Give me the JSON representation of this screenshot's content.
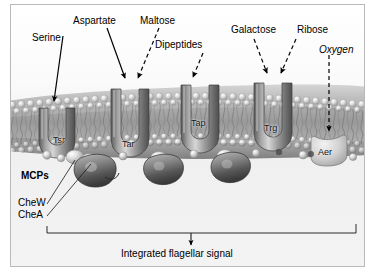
{
  "figure": {
    "background_color": "#f4f4f4",
    "border_color": "#b9b9b9",
    "ink_color": "#000000"
  },
  "ligand_labels": [
    {
      "name": "serine",
      "text": "Serine",
      "arrow": "solid",
      "target": "Tsr"
    },
    {
      "name": "aspartate",
      "text": "Aspartate",
      "arrow": "solid",
      "target": "Tar"
    },
    {
      "name": "maltose",
      "text": "Maltose",
      "arrow": "dashed",
      "target": "Tar"
    },
    {
      "name": "dipeptides",
      "text": "Dipeptides",
      "arrow": "dashed",
      "target": "Tap"
    },
    {
      "name": "galactose",
      "text": "Galactose",
      "arrow": "dashed",
      "target": "Trg"
    },
    {
      "name": "ribose",
      "text": "Ribose",
      "arrow": "dashed",
      "target": "Trg"
    },
    {
      "name": "oxygen",
      "text": "Oxygen",
      "arrow": "dashed",
      "target": "Aer",
      "style": "italic"
    }
  ],
  "receptors": [
    {
      "name": "tsr",
      "text": "Tsr"
    },
    {
      "name": "tar",
      "text": "Tar"
    },
    {
      "name": "tap",
      "text": "Tap"
    },
    {
      "name": "trg",
      "text": "Trg"
    },
    {
      "name": "aer",
      "text": "Aer"
    }
  ],
  "annotations": {
    "mcps": "MCPs",
    "chew": "CheW",
    "chea": "CheA"
  },
  "output": {
    "signal_label": "Integrated flagellar signal"
  }
}
